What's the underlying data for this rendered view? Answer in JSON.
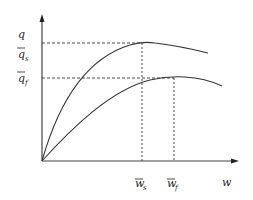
{
  "diagram": {
    "y_axis": {
      "label": "q"
    },
    "x_axis": {
      "label": "w"
    },
    "y_ticks": [
      {
        "base": "q",
        "sub": "s",
        "bar": true
      },
      {
        "base": "q",
        "sub": "f",
        "bar": true
      }
    ],
    "x_ticks": [
      {
        "base": "w",
        "sub": "s",
        "bar": true
      },
      {
        "base": "w",
        "sub": "f",
        "bar": true
      }
    ],
    "curves": [
      {
        "name": "s-curve",
        "peak_label": "q̄s at w̄s"
      },
      {
        "name": "f-curve",
        "peak_label": "q̄f at w̄f"
      }
    ],
    "colors": {
      "line": "#333333",
      "dash": "#333333"
    }
  }
}
